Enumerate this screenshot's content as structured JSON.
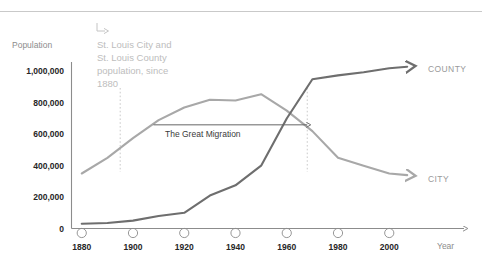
{
  "caption": {
    "arrow_icon": "corner-down-right-arrow-icon",
    "lines": [
      "St. Louis City and",
      "St. Louis County",
      "population, since",
      "1880"
    ]
  },
  "colors": {
    "background": "#ffffff",
    "divider": "#c9c9c9",
    "axis": "#8c8c8c",
    "city_line": "#a8a8a8",
    "county_line": "#6e6e6e",
    "tick_label": "#262626",
    "axis_title": "#8c8c8c",
    "caption": "#bdbdbd",
    "series_label": "#9a9a9a",
    "annotation": "#3a3a3a",
    "guide_line": "#c4c4c4"
  },
  "annotations": {
    "great_migration": {
      "label": "The Great Migration",
      "arrow_icon": "right-arrow-icon",
      "x_start": 1908,
      "x_end": 1968,
      "y": 660000
    },
    "guide_lines": [
      {
        "name": "guide-1895",
        "year": 1895
      },
      {
        "name": "guide-1968",
        "year": 1968
      }
    ]
  },
  "chart_data": {
    "type": "line",
    "title": "",
    "subtitle": "",
    "xlabel": "Year",
    "ylabel": "Population",
    "xlim": [
      1876,
      2012
    ],
    "ylim": [
      0,
      1060000
    ],
    "xticks": [
      1880,
      1900,
      1920,
      1940,
      1960,
      1980,
      2000
    ],
    "xtick_labels": [
      "1880",
      "1900",
      "1920",
      "1940",
      "1960",
      "1980",
      "2000"
    ],
    "yticks": [
      0,
      200000,
      400000,
      600000,
      800000,
      1000000
    ],
    "ytick_labels": [
      "0",
      "200,000",
      "400,000",
      "600,000",
      "800,000",
      "1,000,000"
    ],
    "grid": false,
    "legend_position": "right-end-of-line",
    "series": [
      {
        "name": "CITY",
        "label": "CITY",
        "color": "#a8a8a8",
        "x": [
          1880,
          1890,
          1900,
          1910,
          1920,
          1930,
          1940,
          1950,
          1960,
          1970,
          1980,
          1990,
          2000,
          2007
        ],
        "values": [
          350000,
          450000,
          575000,
          690000,
          770000,
          820000,
          815000,
          855000,
          750000,
          620000,
          450000,
          400000,
          350000,
          340000
        ]
      },
      {
        "name": "COUNTY",
        "label": "COUNTY",
        "color": "#6e6e6e",
        "x": [
          1880,
          1890,
          1900,
          1910,
          1920,
          1930,
          1940,
          1950,
          1960,
          1970,
          1980,
          1990,
          2000,
          2007
        ],
        "values": [
          30000,
          35000,
          50000,
          80000,
          100000,
          210000,
          275000,
          400000,
          700000,
          950000,
          975000,
          995000,
          1020000,
          1030000
        ]
      }
    ]
  }
}
